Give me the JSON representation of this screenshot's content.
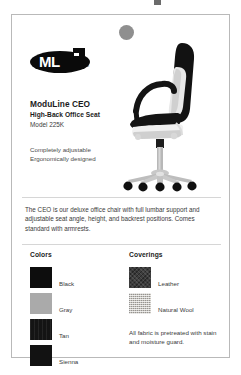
{
  "page": {
    "background_color": "#ffffff",
    "card_border_color": "#b9b9b9"
  },
  "logo": {
    "name": "moduline-logo",
    "text": "ML",
    "subtext": "MODULINE"
  },
  "product": {
    "title": "ModuLine CEO",
    "subtitle": "High-Back Office Seat",
    "model": "Model 225K",
    "features": [
      "Completely adjustable",
      "Ergonomically designed"
    ]
  },
  "image": {
    "alt": "high-back office chair side profile",
    "icon": "office-chair-photo"
  },
  "description": {
    "text": "The CEO is our deluxe office chair with full lumbar support and adjustable seat angle, height, and backrest positions. Comes standard with armrests."
  },
  "colors": {
    "heading": "Colors",
    "items": [
      {
        "label": "Black",
        "hex": "#0d0d0d",
        "style": "solid"
      },
      {
        "label": "Gray",
        "hex": "#aaaaaa",
        "style": "solid"
      },
      {
        "label": "Tan",
        "hex": "#141414",
        "style": "tan-texture"
      },
      {
        "label": "Sienna",
        "hex": "#121212",
        "style": "solid"
      }
    ]
  },
  "coverings": {
    "heading": "Coverings",
    "items": [
      {
        "label": "Leather",
        "hex": "#3c3c3c",
        "style": "leather-texture"
      },
      {
        "label": "Natural Wool",
        "hex": "#c6c3bd",
        "style": "wool-texture"
      }
    ],
    "note": "All fabric is pretreated with stain and moisture guard."
  }
}
